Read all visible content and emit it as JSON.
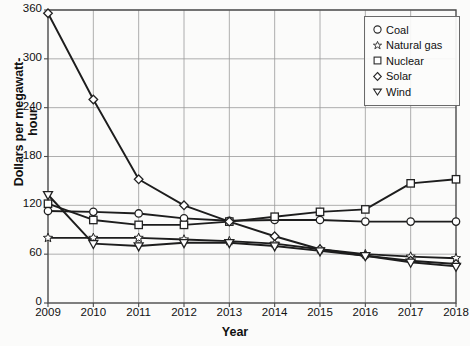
{
  "chart_data": {
    "type": "line",
    "title": "",
    "xlabel": "Year",
    "ylabel": "Dollars per megawatt-hour",
    "x": [
      2009,
      2010,
      2011,
      2012,
      2013,
      2014,
      2015,
      2016,
      2017,
      2018
    ],
    "xtick_labels": [
      "2009",
      "2010",
      "2011",
      "2012",
      "2013",
      "2014",
      "2015",
      "2016",
      "2017",
      "2018"
    ],
    "ytick_labels": [
      "0",
      "60",
      "120",
      "180",
      "240",
      "300",
      "360"
    ],
    "yticks": [
      0,
      60,
      120,
      180,
      240,
      300,
      360
    ],
    "xlim": [
      2009,
      2018
    ],
    "ylim": [
      0,
      360
    ],
    "grid": true,
    "legend_position": "top-right",
    "series": [
      {
        "name": "Coal",
        "marker": "circle",
        "values": [
          113,
          112,
          110,
          104,
          101,
          102,
          102,
          100,
          100,
          100
        ]
      },
      {
        "name": "Natural gas",
        "marker": "star",
        "values": [
          80,
          80,
          80,
          78,
          76,
          73,
          66,
          60,
          57,
          55
        ]
      },
      {
        "name": "Nuclear",
        "marker": "square",
        "values": [
          122,
          102,
          96,
          96,
          100,
          106,
          112,
          115,
          147,
          152
        ]
      },
      {
        "name": "Solar",
        "marker": "diamond",
        "values": [
          356,
          250,
          152,
          120,
          100,
          82,
          66,
          58,
          52,
          48
        ]
      },
      {
        "name": "Wind",
        "marker": "triangle-down",
        "values": [
          133,
          73,
          70,
          74,
          74,
          70,
          64,
          58,
          50,
          45
        ]
      }
    ]
  }
}
